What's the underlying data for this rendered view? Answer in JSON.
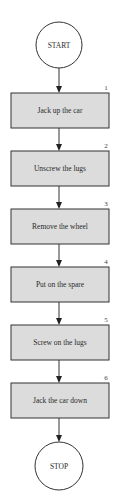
{
  "flowchart": {
    "start_label": "START",
    "stop_label": "STOP",
    "steps": [
      {
        "number": "1",
        "label": "Jack up the car"
      },
      {
        "number": "2",
        "label": "Unscrew the lugs"
      },
      {
        "number": "3",
        "label": "Remove the wheel"
      },
      {
        "number": "4",
        "label": "Put on the spare"
      },
      {
        "number": "5",
        "label": "Screw on the lugs"
      },
      {
        "number": "6",
        "label": "Jack the car down"
      }
    ],
    "colors": {
      "box_fill": "#dcdcdc",
      "stroke": "#333333",
      "background": "#ffffff"
    }
  }
}
